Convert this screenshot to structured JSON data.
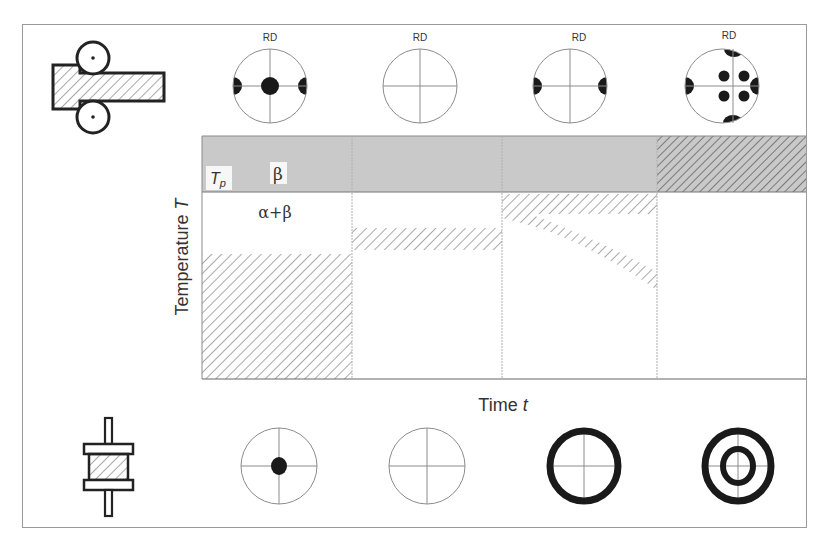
{
  "diagram": {
    "pole_label": "RD",
    "axis": {
      "y_label": "Temperature ",
      "y_symbol": "T",
      "x_label": "Time ",
      "x_symbol": "t"
    },
    "regions": {
      "beta": "β",
      "alpha_beta": "α+β",
      "tp_main": "T",
      "tp_sub": "p"
    },
    "process_icons": [
      {
        "name": "rolling",
        "row": "top"
      },
      {
        "name": "upsetting-press",
        "row": "bottom"
      }
    ],
    "top_pole_figures": [
      {
        "type": "center-and-side-poles"
      },
      {
        "type": "empty"
      },
      {
        "type": "side-poles"
      },
      {
        "type": "six-spot-plus-four-edge-poles"
      }
    ],
    "bottom_pole_figures": [
      {
        "type": "center-pole"
      },
      {
        "type": "empty"
      },
      {
        "type": "outer-ring"
      },
      {
        "type": "double-ring"
      }
    ],
    "colors": {
      "frame": "#8a8a8a",
      "beta_band": "#c9c9c9",
      "hatch": "#7a7a7a",
      "ink": "#222222",
      "thin_line": "#8c8c8c"
    }
  }
}
